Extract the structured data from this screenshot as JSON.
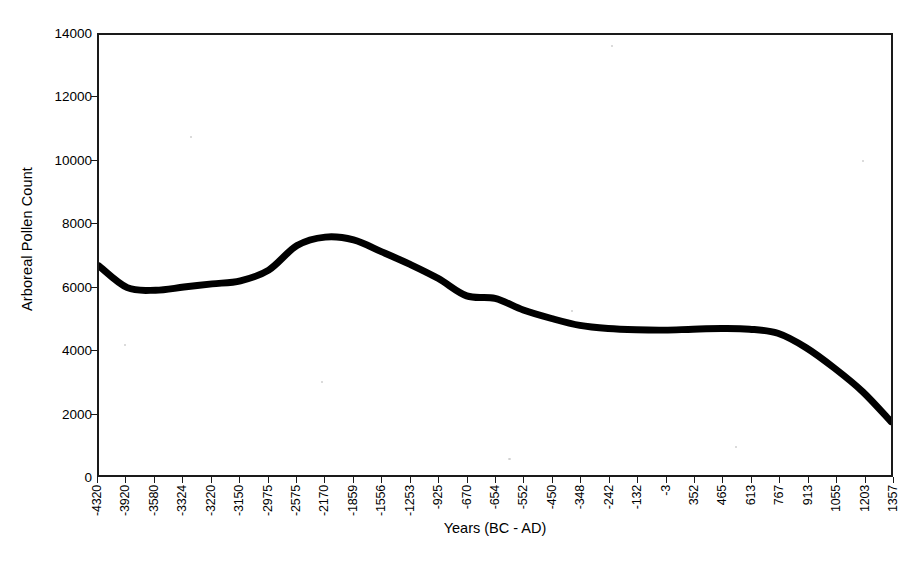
{
  "chart_data": {
    "type": "line",
    "title": "",
    "xlabel": "Years (BC - AD)",
    "ylabel": "Arboreal Pollen Count",
    "ylim": [
      0,
      14000
    ],
    "ytick_values": [
      0,
      2000,
      4000,
      6000,
      8000,
      10000,
      12000,
      14000
    ],
    "ytick_labels": [
      "0",
      "2000",
      "4000",
      "6000",
      "8000",
      "10000",
      "12000",
      "14000"
    ],
    "grid": false,
    "legend": false,
    "legend_position": "none",
    "line_color": "#000000",
    "line_width": 7,
    "categories": [
      "-4320",
      "-3920",
      "-3580",
      "-3324",
      "-3220",
      "-3150",
      "-2975",
      "-2575",
      "-2170",
      "-1859",
      "-1556",
      "-1253",
      "-925",
      "-670",
      "-654",
      "-552",
      "-450",
      "-348",
      "-242",
      "-132",
      "-3",
      "352",
      "465",
      "613",
      "767",
      "913",
      "1055",
      "1203",
      "1357"
    ],
    "values": [
      6650,
      5960,
      5880,
      5980,
      6080,
      6180,
      6520,
      7300,
      7570,
      7480,
      7100,
      6700,
      6250,
      5700,
      5620,
      5250,
      4980,
      4760,
      4660,
      4620,
      4610,
      4640,
      4660,
      4640,
      4510,
      4050,
      3400,
      2650,
      1700
    ],
    "series": [
      {
        "name": "Arboreal Pollen Count",
        "values": [
          6650,
          5960,
          5880,
          5980,
          6080,
          6180,
          6520,
          7300,
          7570,
          7480,
          7100,
          6700,
          6250,
          5700,
          5620,
          5250,
          4980,
          4760,
          4660,
          4620,
          4610,
          4640,
          4660,
          4640,
          4510,
          4050,
          3400,
          2650,
          1700
        ]
      }
    ],
    "annotations": []
  }
}
